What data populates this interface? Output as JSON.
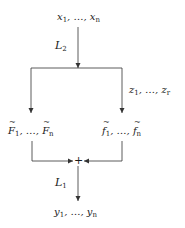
{
  "diagram": {
    "nodes": {
      "input": {
        "label": "x₁, …, xₙ",
        "var": "x",
        "start_index": "1",
        "end_index": "n"
      },
      "latent": {
        "label": "z₁, …, zᵣ",
        "var": "z",
        "start_index": "1",
        "end_index": "r"
      },
      "left_branch": {
        "label": "F̃₁, …, F̃ₙ",
        "var": "F",
        "tilde": true,
        "start_index": "1",
        "end_index": "n"
      },
      "right_branch": {
        "label": "f̃₁, …, f̃ₙ",
        "var": "f",
        "tilde": true,
        "start_index": "1",
        "end_index": "n"
      },
      "sum": {
        "label": "+"
      },
      "output": {
        "label": "y₁, …, yₙ",
        "var": "y",
        "start_index": "1",
        "end_index": "n"
      }
    },
    "edges": [
      {
        "from": "input",
        "to": "split",
        "label": "L₂",
        "label_var": "L",
        "label_index": "2"
      },
      {
        "from": "split",
        "to": "left_branch",
        "label": ""
      },
      {
        "from": "split",
        "to": "right_branch",
        "label": ""
      },
      {
        "from": "left_branch",
        "to": "sum",
        "label": ""
      },
      {
        "from": "right_branch",
        "to": "sum",
        "label": ""
      },
      {
        "from": "sum",
        "to": "output",
        "label": "L₁",
        "label_var": "L",
        "label_index": "1"
      }
    ],
    "line_color": "#333333",
    "text_color": "#1a1a1a"
  }
}
